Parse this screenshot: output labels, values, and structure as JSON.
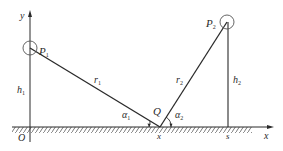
{
  "diagram": {
    "colors": {
      "line": "#2a2a2a",
      "hatch": "#555555",
      "circle": "#555555",
      "background": "#ffffff"
    },
    "axes": {
      "x_label": "x",
      "y_label": "y",
      "origin_label": "O"
    },
    "points": {
      "p1": {
        "label": "P",
        "sub": "1"
      },
      "p2": {
        "label": "P",
        "sub": "2"
      },
      "q": {
        "label": "Q"
      }
    },
    "segments": {
      "r1": {
        "label": "r",
        "sub": "1"
      },
      "r2": {
        "label": "r",
        "sub": "2"
      },
      "h1": {
        "label": "h",
        "sub": "1"
      },
      "h2": {
        "label": "h",
        "sub": "2"
      }
    },
    "angles": {
      "a1": {
        "label": "α",
        "sub": "1"
      },
      "a2": {
        "label": "α",
        "sub": "2"
      }
    },
    "ground_ticks": {
      "q_x": "x",
      "s": "s"
    }
  }
}
